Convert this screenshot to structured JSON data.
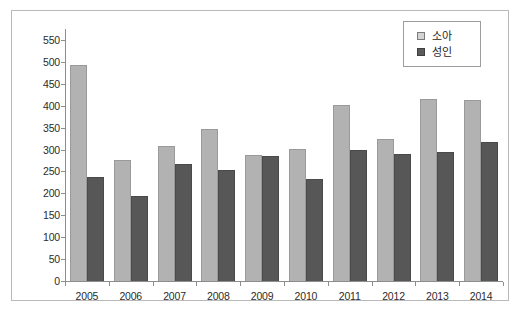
{
  "chart_data": {
    "type": "bar",
    "title": "",
    "subtitle": "",
    "xlabel": "",
    "ylabel": "",
    "ylim": [
      0,
      550
    ],
    "ytick_step": 50,
    "grid": false,
    "legend_position": "top-right",
    "categories": [
      "2005",
      "2006",
      "2007",
      "2008",
      "2009",
      "2010",
      "2011",
      "2012",
      "2013",
      "2014"
    ],
    "ytick_labels": [
      "550",
      "500",
      "450",
      "400",
      "350",
      "300",
      "250",
      "200",
      "150",
      "100",
      "50",
      "0"
    ],
    "series": [
      {
        "name": "소아",
        "color": "#b2b2b2",
        "values": [
          492,
          276,
          309,
          348,
          287,
          302,
          401,
          323,
          415,
          412
        ]
      },
      {
        "name": "성인",
        "color": "#575757",
        "values": [
          237,
          193,
          267,
          253,
          286,
          233,
          299,
          289,
          295,
          318
        ]
      }
    ]
  },
  "legend": {
    "items": [
      {
        "label": "소아",
        "swatch": "legend-swatch-light"
      },
      {
        "label": "성인",
        "swatch": "legend-swatch-dark"
      }
    ]
  }
}
